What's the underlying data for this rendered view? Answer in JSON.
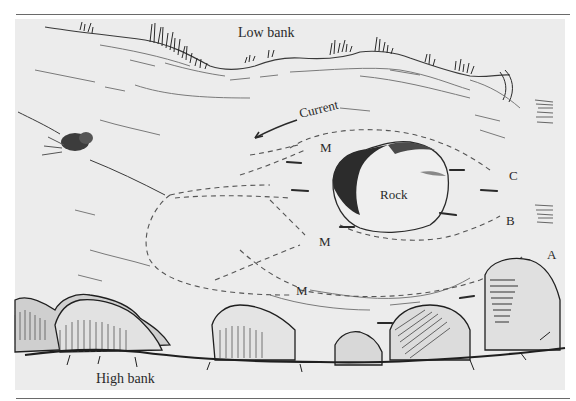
{
  "figure": {
    "type": "stream-diagram",
    "labels": {
      "low_bank": "Low bank",
      "high_bank": "High bank",
      "current": "Current",
      "rock": "Rock",
      "marker_m_top": "M",
      "marker_m_middle": "M",
      "marker_m_bottom": "M",
      "lane_c": "C",
      "lane_b": "B",
      "lane_a": "A"
    },
    "elements": {
      "rock": "boulder mid-stream",
      "animal": "otter/creature at left on bank line",
      "fish": "small fish dashes around rock",
      "current_arrow": "arrow pointing left-down"
    },
    "colors": {
      "background": "#ffffff",
      "panel": "#ececec",
      "ink": "#2a2a2a",
      "rule": "#6a6a6a"
    }
  }
}
